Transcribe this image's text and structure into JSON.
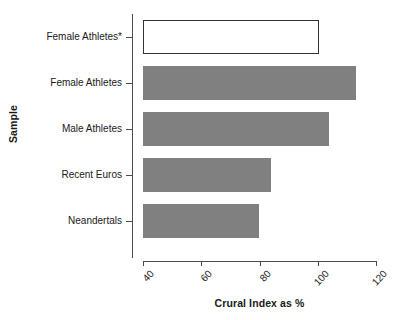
{
  "chart_data": {
    "type": "bar",
    "orientation": "horizontal",
    "title": "",
    "xlabel": "Crural Index as %",
    "ylabel": "Sample",
    "xlim": [
      40,
      120
    ],
    "xticks": [
      40,
      60,
      80,
      100,
      120
    ],
    "xtick_labels": [
      "40",
      "60",
      "80",
      "100",
      "120"
    ],
    "grid": false,
    "legend": null,
    "categories": [
      "Female Athletes*",
      "Female Athletes",
      "Male Athletes",
      "Recent Euros",
      "Neandertals"
    ],
    "values": [
      100.3,
      113.1,
      103.8,
      83.8,
      79.7
    ],
    "bars": [
      {
        "label": "Female Athletes*",
        "value": 100.3,
        "style": "outlined",
        "fill": "#ffffff",
        "stroke": "#333333"
      },
      {
        "label": "Female Athletes",
        "value": 113.1,
        "style": "filled",
        "fill": "#808080",
        "stroke": "#808080"
      },
      {
        "label": "Male Athletes",
        "value": 103.8,
        "style": "filled",
        "fill": "#808080",
        "stroke": "#808080"
      },
      {
        "label": "Recent Euros",
        "value": 83.8,
        "style": "filled",
        "fill": "#808080",
        "stroke": "#808080"
      },
      {
        "label": "Neandertals",
        "value": 79.7,
        "style": "filled",
        "fill": "#808080",
        "stroke": "#808080"
      }
    ],
    "colors": {
      "bar_fill": "#808080",
      "bar_outline": "#333333",
      "axis": "#4d4d4d",
      "text": "#1a1a1a",
      "background": "#ffffff"
    }
  }
}
